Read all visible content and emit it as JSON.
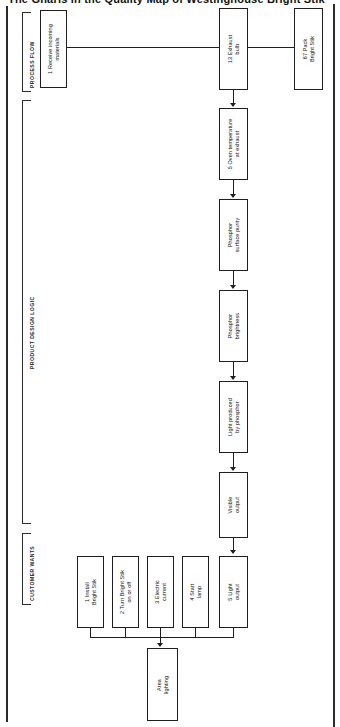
{
  "page": {
    "title": "The Gnarls in the Quality Map of Westinghouse Bright Stik"
  },
  "sections": [
    {
      "id": "process-flow",
      "label": "PROCESS FLOW"
    },
    {
      "id": "product-design-logic",
      "label": "PRODUCT DESIGN LOGIC"
    },
    {
      "id": "customer-wants",
      "label": "CUSTOMER WANTS"
    }
  ],
  "process_flow": {
    "nodes": [
      {
        "id": "receive-incoming-materials",
        "number": "1",
        "text": "Receive incoming\nmaterials"
      },
      {
        "id": "exhaust-bulb",
        "number": "13",
        "text": "Exhaust\nbulb"
      },
      {
        "id": "pack-bright-stik",
        "number": "67",
        "text": "Pack\nBright Stik"
      }
    ]
  },
  "product_design_logic": {
    "nodes": [
      {
        "id": "oven-temperature-at-exhaust",
        "number": "5",
        "text": "Oven temperature\nat exhaust"
      },
      {
        "id": "phosphor-surface-purity",
        "number": "",
        "text": "Phosphor\nsurface purity"
      },
      {
        "id": "phosphor-brightness",
        "number": "",
        "text": "Phosphor\nbrightness"
      },
      {
        "id": "light-produced-by-phosphor",
        "number": "",
        "text": "Light produced\nby phosphor"
      },
      {
        "id": "visible-output",
        "number": "",
        "text": "Visible\noutput"
      }
    ]
  },
  "customer_wants": {
    "nodes": [
      {
        "id": "install-bright-stik",
        "number": "1",
        "text": "Install\nBright Stik"
      },
      {
        "id": "turn-bright-stik-on-off",
        "number": "2",
        "text": "Turn Bright Stik\non or off"
      },
      {
        "id": "electric-current",
        "number": "3",
        "text": "Electric\ncurrent"
      },
      {
        "id": "start-lamp",
        "number": "4",
        "text": "Start\nlamp"
      },
      {
        "id": "light-output",
        "number": "5",
        "text": "Light\noutput"
      }
    ],
    "outcome": {
      "id": "area-lighting",
      "number": "",
      "text": "Area\nlighting"
    }
  },
  "chart_data": {
    "type": "diagram",
    "orientation": "rotated-90-ccw",
    "title": "The Gnarls in the Quality Map of Westinghouse Bright Stik",
    "swimlanes": [
      "PROCESS FLOW",
      "PRODUCT DESIGN LOGIC",
      "CUSTOMER WANTS"
    ],
    "nodes": [
      "1 Receive incoming materials",
      "13 Exhaust bulb",
      "67 Pack Bright Stik",
      "5 Oven temperature at exhaust",
      "Phosphor surface purity",
      "Phosphor brightness",
      "Light produced by phosphor",
      "Visible output",
      "1 Install Bright Stik",
      "2 Turn Bright Stik on or off",
      "3 Electric current",
      "4 Start lamp",
      "5 Light output",
      "Area lighting"
    ],
    "edges": [
      [
        "1 Receive incoming materials",
        "13 Exhaust bulb"
      ],
      [
        "13 Exhaust bulb",
        "67 Pack Bright Stik"
      ],
      [
        "13 Exhaust bulb",
        "5 Oven temperature at exhaust"
      ],
      [
        "5 Oven temperature at exhaust",
        "Phosphor surface purity"
      ],
      [
        "Phosphor surface purity",
        "Phosphor brightness"
      ],
      [
        "Phosphor brightness",
        "Light produced by phosphor"
      ],
      [
        "Light produced by phosphor",
        "Visible output"
      ],
      [
        "Visible output",
        "5 Light output"
      ],
      [
        "1 Install Bright Stik",
        "Area lighting"
      ],
      [
        "2 Turn Bright Stik on or off",
        "Area lighting"
      ],
      [
        "3 Electric current",
        "Area lighting"
      ],
      [
        "4 Start lamp",
        "Area lighting"
      ],
      [
        "5 Light output",
        "Area lighting"
      ]
    ]
  }
}
